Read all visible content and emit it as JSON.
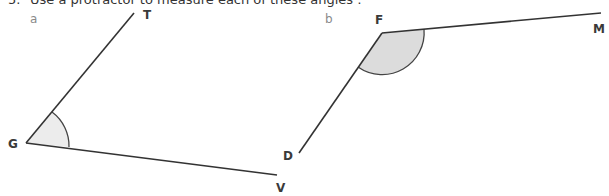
{
  "question": {
    "number": "5.",
    "text": "Use a protractor to measure each of these angles :"
  },
  "angles": [
    {
      "part_label": "a",
      "vertex": {
        "name": "G",
        "x": 26,
        "y": 143
      },
      "arm1": {
        "name": "T",
        "x": 134,
        "y": 13
      },
      "arm2": {
        "name": "V",
        "x": 277,
        "y": 175
      },
      "arc_fill": "#ececec"
    },
    {
      "part_label": "b",
      "vertex": {
        "name": "F",
        "x": 382,
        "y": 33
      },
      "arm1": {
        "name": "M",
        "x": 601,
        "y": 13
      },
      "arm2": {
        "name": "D",
        "x": 299,
        "y": 153
      },
      "arc_fill": "#dcdcdc"
    }
  ],
  "colors": {
    "line": "#333333",
    "label": "#3a3a3a",
    "part_label": "#8a8a8a"
  }
}
